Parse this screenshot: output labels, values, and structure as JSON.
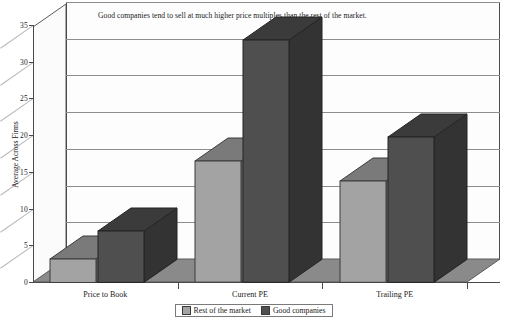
{
  "chart_data": {
    "type": "bar",
    "title": "Good companies tend to sell at much higher price multiples than the rest of the market.",
    "xlabel": "",
    "ylabel": "Average Across Firms",
    "categories": [
      "Price to Book",
      "Current PE",
      "Trailing PE"
    ],
    "series": [
      {
        "name": "Rest of the market",
        "color": "#a3a3a3",
        "values": [
          3.2,
          16.5,
          13.8
        ]
      },
      {
        "name": "Good companies",
        "color": "#4f4f4f",
        "values": [
          7.0,
          33.0,
          19.8
        ]
      }
    ],
    "ylim": [
      0,
      35
    ],
    "yticks": [
      0,
      5,
      10,
      15,
      20,
      25,
      30,
      35
    ],
    "ytick_labels": [
      "0",
      "5",
      "10",
      "15",
      "20",
      "25",
      "30",
      "35"
    ],
    "grid": true,
    "legend_position": "bottom",
    "style": "3d-column"
  },
  "legend": {
    "items": [
      {
        "label": "Rest of the market"
      },
      {
        "label": "Good companies"
      }
    ]
  }
}
